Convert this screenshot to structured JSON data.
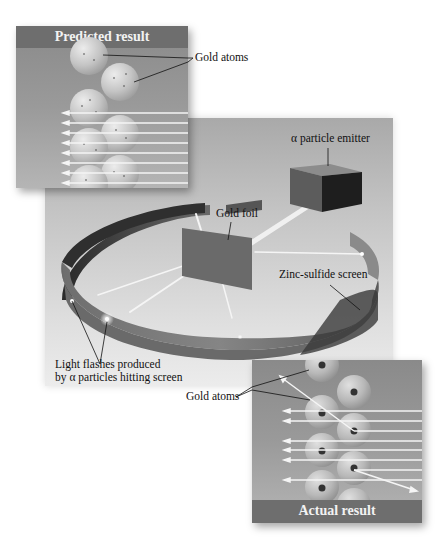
{
  "diagram": {
    "colors": {
      "background": "#ffffff",
      "stage": "#c4c4c4",
      "panel_bg": "#9a9a9a",
      "panel_title_bar": "#6e6e6e",
      "screen_ring": "#7a7a7a",
      "ring_inner": "#3c3c3c",
      "beam": "#f5f5f5",
      "atom_fill": "#cfcfcf",
      "nucleus": "#333333"
    }
  },
  "predicted_panel": {
    "title": "Predicted result",
    "atoms_label": "Gold atoms",
    "arrow_count": 8
  },
  "apparatus": {
    "emitter_label": "α particle emitter",
    "foil_label": "Gold foil",
    "screen_label": "Zinc-sulfide screen",
    "flashes_label_line1": "Light flashes produced",
    "flashes_label_line2": "by α particles hitting screen"
  },
  "actual_panel": {
    "title": "Actual result",
    "atoms_label": "Gold atoms",
    "arrow_count": 9,
    "deflected_count": 2
  }
}
